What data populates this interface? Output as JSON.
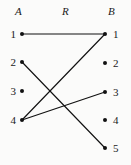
{
  "figure": {
    "background_color": "#fbfbfa",
    "ink_color": "#111111",
    "width": 131,
    "height": 165
  },
  "headers": {
    "left": "A",
    "middle": "R",
    "right": "B"
  },
  "chart_data": {
    "type": "diagram",
    "subtype": "bipartite-relation-arrow-diagram",
    "sets": [
      {
        "name": "A",
        "side": "left",
        "elements": [
          "1",
          "2",
          "3",
          "4"
        ]
      },
      {
        "name": "B",
        "side": "right",
        "elements": [
          "1",
          "2",
          "3",
          "4",
          "5"
        ]
      }
    ],
    "relation_name": "R",
    "edges": [
      {
        "from_set": "A",
        "from": "1",
        "to_set": "B",
        "to": "1"
      },
      {
        "from_set": "A",
        "from": "2",
        "to_set": "B",
        "to": "5"
      },
      {
        "from_set": "A",
        "from": "4",
        "to_set": "B",
        "to": "1"
      },
      {
        "from_set": "A",
        "from": "4",
        "to_set": "B",
        "to": "3"
      }
    ],
    "pairs": [
      "(1,1)",
      "(2,5)",
      "(4,1)",
      "(4,3)"
    ],
    "isolated_domain_elements": [
      "3"
    ],
    "isolated_codomain_elements": [
      "2",
      "4"
    ],
    "legend": [],
    "grid": false
  },
  "geometry": {
    "left_nodes": [
      {
        "label": "1",
        "x": 22,
        "y": 34
      },
      {
        "label": "2",
        "x": 22,
        "y": 62
      },
      {
        "label": "3",
        "x": 22,
        "y": 91
      },
      {
        "label": "4",
        "x": 22,
        "y": 120
      }
    ],
    "right_nodes": [
      {
        "label": "1",
        "x": 105,
        "y": 34
      },
      {
        "label": "2",
        "x": 105,
        "y": 63
      },
      {
        "label": "3",
        "x": 105,
        "y": 92
      },
      {
        "label": "4",
        "x": 105,
        "y": 120
      },
      {
        "label": "5",
        "x": 105,
        "y": 148
      }
    ],
    "edge_lines": [
      {
        "x1": 22,
        "y1": 34,
        "x2": 105,
        "y2": 34
      },
      {
        "x1": 22,
        "y1": 62,
        "x2": 105,
        "y2": 148
      },
      {
        "x1": 22,
        "y1": 120,
        "x2": 105,
        "y2": 34
      },
      {
        "x1": 22,
        "y1": 120,
        "x2": 105,
        "y2": 92
      }
    ]
  }
}
